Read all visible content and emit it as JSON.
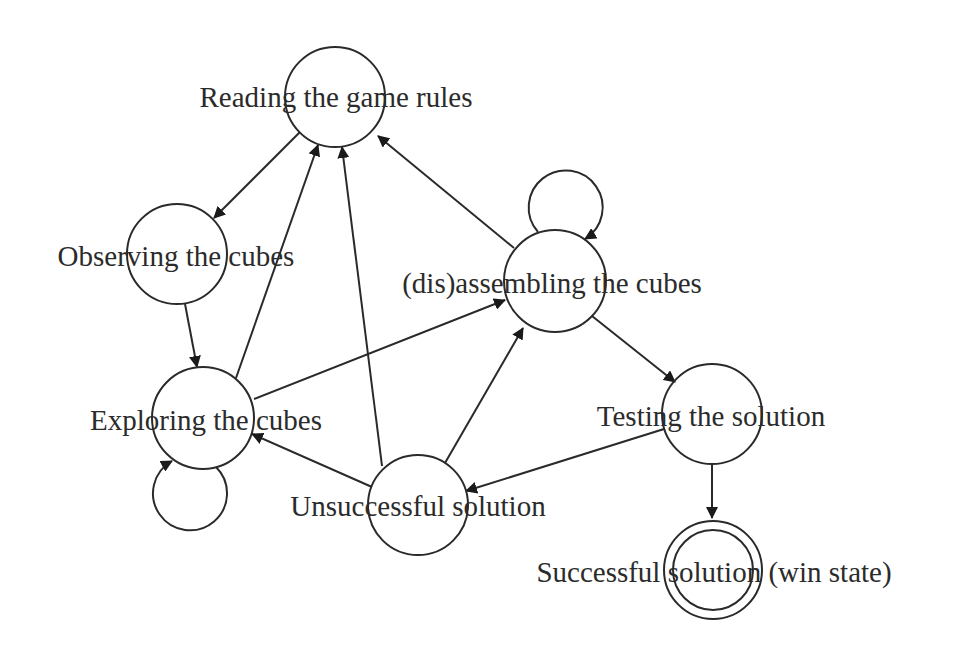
{
  "diagram": {
    "type": "state-diagram",
    "nodes": [
      {
        "id": "reading",
        "label": "Reading the game rules",
        "final": false
      },
      {
        "id": "observing",
        "label": "Observing the cubes",
        "final": false
      },
      {
        "id": "exploring",
        "label": "Exploring the cubes",
        "final": false
      },
      {
        "id": "assembling",
        "label": "(dis)assembling the cubes",
        "final": false
      },
      {
        "id": "testing",
        "label": "Testing the solution",
        "final": false
      },
      {
        "id": "unsuccessful",
        "label": "Unsuccessful solution",
        "final": false
      },
      {
        "id": "successful",
        "label": "Successful solution (win state)",
        "final": true
      }
    ],
    "edges": [
      {
        "from": "reading",
        "to": "observing"
      },
      {
        "from": "observing",
        "to": "exploring"
      },
      {
        "from": "exploring",
        "to": "reading"
      },
      {
        "from": "exploring",
        "to": "exploring"
      },
      {
        "from": "exploring",
        "to": "assembling"
      },
      {
        "from": "assembling",
        "to": "reading"
      },
      {
        "from": "assembling",
        "to": "assembling"
      },
      {
        "from": "assembling",
        "to": "testing"
      },
      {
        "from": "testing",
        "to": "unsuccessful"
      },
      {
        "from": "testing",
        "to": "successful"
      },
      {
        "from": "unsuccessful",
        "to": "reading"
      },
      {
        "from": "unsuccessful",
        "to": "exploring"
      },
      {
        "from": "unsuccessful",
        "to": "assembling"
      }
    ]
  }
}
